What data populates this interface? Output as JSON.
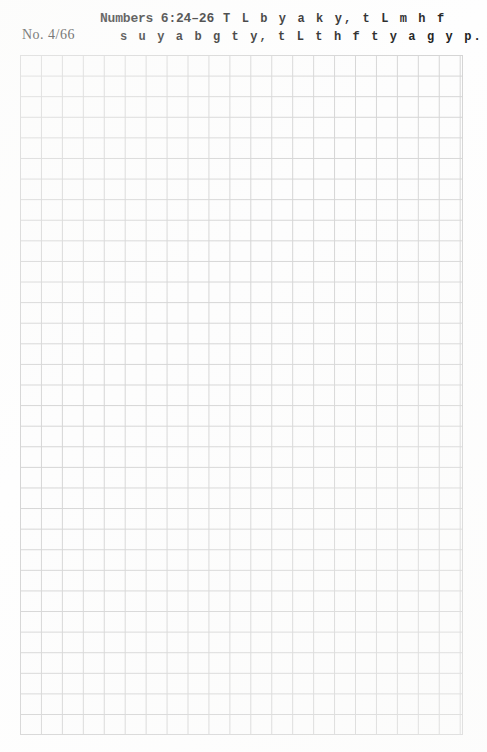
{
  "page": {
    "sheet_label": "No. 4/66",
    "paper_color": "#fdfdfd",
    "grid_line_color": "#d5d5d5",
    "ink_color": "#1d1d1d"
  },
  "header": {
    "verse_title": "Numbers 6:24–26",
    "line_1_text": "T L b y a k y, t L m h f",
    "line_2_text": "s u y a b g t y, t L t h f t y a g y p."
  },
  "grid": {
    "columns": 21,
    "rows": 33,
    "cell_width_px": 20.95,
    "cell_height_px": 20.6,
    "left_px": 20,
    "top_px": 55,
    "width_px": 443,
    "height_px": 680
  }
}
